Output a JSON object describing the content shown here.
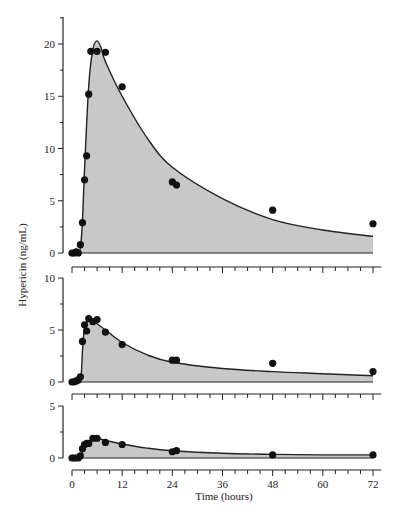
{
  "chart_data": [
    {
      "type": "line",
      "panel": "top",
      "title": "",
      "xlabel": "",
      "ylabel": "Hypericin (ng/mL)",
      "ylim": [
        0,
        22
      ],
      "yticks": [
        0,
        5,
        10,
        15,
        20
      ],
      "xlim": [
        0,
        72
      ],
      "grid": false,
      "fill": "area under fitted curve shaded gray",
      "points": {
        "x": [
          0,
          0.5,
          1,
          1.5,
          2,
          2.5,
          3,
          3.5,
          4,
          4.5,
          6,
          8,
          12,
          24,
          25,
          48,
          72
        ],
        "y": [
          0,
          0,
          0.1,
          0,
          0.8,
          2.9,
          7.0,
          9.3,
          15.2,
          19.3,
          19.3,
          19.2,
          15.9,
          6.8,
          6.5,
          4.1,
          2.8
        ]
      },
      "fit_curve": {
        "x": [
          0,
          1.5,
          2,
          2.5,
          3,
          4,
          5,
          6,
          7,
          8,
          12,
          18,
          24,
          36,
          48,
          60,
          72
        ],
        "y": [
          0,
          0,
          0.5,
          3,
          8,
          16,
          19.5,
          20.3,
          19.6,
          18.3,
          15,
          11,
          8.2,
          5.2,
          3.2,
          2.2,
          1.6
        ]
      }
    },
    {
      "type": "line",
      "panel": "middle",
      "ylabel": "",
      "ylim": [
        0,
        10
      ],
      "yticks": [
        0,
        5,
        10
      ],
      "xlim": [
        0,
        72
      ],
      "points": {
        "x": [
          0,
          0.5,
          1,
          1.5,
          2,
          2.5,
          3,
          3.5,
          4,
          5,
          6,
          8,
          12,
          24,
          25,
          48,
          72
        ],
        "y": [
          0,
          0,
          0.1,
          0.2,
          0.5,
          3.9,
          5.5,
          4.9,
          6.1,
          5.8,
          6.0,
          4.8,
          3.6,
          2.1,
          2.1,
          1.8,
          1.0
        ]
      },
      "fit_curve": {
        "x": [
          0,
          2,
          2.5,
          3,
          4,
          5,
          6,
          8,
          12,
          18,
          24,
          36,
          48,
          60,
          72
        ],
        "y": [
          0,
          0.3,
          3,
          5.2,
          6.0,
          5.9,
          5.6,
          5.0,
          3.8,
          2.6,
          1.9,
          1.3,
          1.0,
          0.8,
          0.6
        ]
      }
    },
    {
      "type": "line",
      "panel": "bottom",
      "xlabel": "Time (hours)",
      "ylabel": "",
      "ylim": [
        0,
        5
      ],
      "yticks": [
        0,
        5
      ],
      "xlim": [
        0,
        72
      ],
      "xticks": [
        0,
        12,
        24,
        36,
        48,
        60,
        72
      ],
      "points": {
        "x": [
          0,
          0.5,
          1,
          1.5,
          2,
          2.5,
          3,
          3.5,
          4,
          5,
          6,
          8,
          12,
          24,
          25,
          48,
          72
        ],
        "y": [
          0,
          0,
          0,
          0,
          0.2,
          0.9,
          1.3,
          1.4,
          1.4,
          1.9,
          1.9,
          1.5,
          1.3,
          0.6,
          0.7,
          0.3,
          0.3
        ]
      },
      "fit_curve": {
        "x": [
          0,
          2,
          3,
          4,
          5,
          6,
          8,
          12,
          18,
          24,
          36,
          48,
          60,
          72
        ],
        "y": [
          0,
          0.2,
          1.1,
          1.6,
          1.8,
          1.85,
          1.7,
          1.35,
          0.95,
          0.7,
          0.45,
          0.35,
          0.3,
          0.3
        ]
      }
    }
  ],
  "labels": {
    "ylabel": "Hypericin (ng/mL)",
    "xlabel": "Time (hours)",
    "xtick_labels": [
      "0",
      "12",
      "24",
      "36",
      "48",
      "60",
      "72"
    ],
    "top_ytick_labels": [
      "0",
      "5",
      "10",
      "15",
      "20"
    ],
    "middle_ytick_labels": [
      "0",
      "5",
      "10"
    ],
    "bottom_ytick_labels": [
      "0",
      "5"
    ]
  },
  "colors": {
    "fill": "#c8c8c8",
    "line": "#222222",
    "marker": "#111111"
  }
}
